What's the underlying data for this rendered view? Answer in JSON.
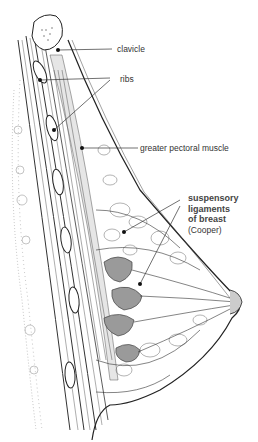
{
  "figure": {
    "colors": {
      "ink": "#222222",
      "label_text": "#333333",
      "bold_label_text": "#444444",
      "background": "#ffffff"
    },
    "labels": [
      {
        "id": "clavicle",
        "text": "clavicle"
      },
      {
        "id": "ribs",
        "text": "ribs"
      },
      {
        "id": "greater-pectoral-muscle",
        "text": "greater pectoral muscle"
      }
    ],
    "suspensory": {
      "line1": "suspensory",
      "line2": "ligaments",
      "line3": "of breast",
      "line4": "(Cooper)"
    }
  }
}
